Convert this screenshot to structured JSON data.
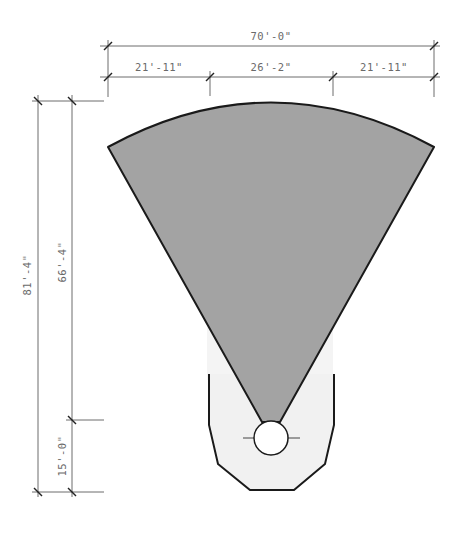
{
  "diagram": {
    "type": "architectural-plan",
    "colors": {
      "sector_fill": "#a3a3a3",
      "base_fill": "#f1f1f1",
      "outline": "#1a1a1a",
      "dimension_line": "#6d6d6d",
      "dimension_text": "#6a6a6a",
      "circle_fill": "#ffffff"
    },
    "dimensions": {
      "horizontal": {
        "overall": "70'-0\"",
        "segments": [
          "21'-11\"",
          "26'-2\"",
          "21'-11\""
        ]
      },
      "vertical": {
        "overall": "81'-4\"",
        "segments": [
          "66'-4\"",
          "15'-0\""
        ]
      }
    }
  }
}
